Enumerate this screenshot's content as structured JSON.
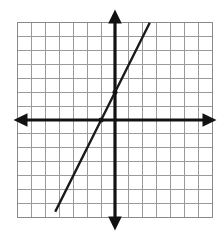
{
  "figure": {
    "background_color": "#ffffff"
  },
  "chart_data": {
    "type": "line",
    "title": "",
    "xlabel": "",
    "ylabel": "",
    "xlim": [
      -7,
      7
    ],
    "ylim": [
      -7,
      7
    ],
    "grid": true,
    "grid_spacing": 1,
    "grid_color": "#9a9a9a",
    "axis_color": "#121212",
    "line_color": "#1a1a1a",
    "legend": "none",
    "tick_labels_shown": false,
    "axes": {
      "x_axis": {
        "name": "x-axis",
        "y_value": 0,
        "arrows": [
          "left",
          "right"
        ]
      },
      "y_axis": {
        "name": "y-axis",
        "x_value": 0,
        "arrows": [
          "up",
          "down"
        ]
      }
    },
    "series": [
      {
        "name": "line",
        "equation": "y = 2x + 2",
        "slope": 2,
        "y_intercept": 2,
        "x_intercept": -1,
        "x": [
          -4.3,
          2.5
        ],
        "values": [
          -6.6,
          7.0
        ],
        "endpoints": [
          {
            "x": -4.3,
            "y": -6.6
          },
          {
            "x": 2.5,
            "y": 7.0
          }
        ]
      }
    ],
    "marked_points": [
      {
        "name": "y-intercept-point",
        "x": 0,
        "y": 2
      },
      {
        "name": "x-intercept-point",
        "x": -1,
        "y": 0
      }
    ]
  },
  "geometry": {
    "origin_px": {
      "x": 115,
      "y": 120
    },
    "cell_px": 13.9,
    "grid_left_px": 17.7,
    "grid_top_px": 22.7,
    "grid_cols": 14,
    "grid_rows": 14
  }
}
